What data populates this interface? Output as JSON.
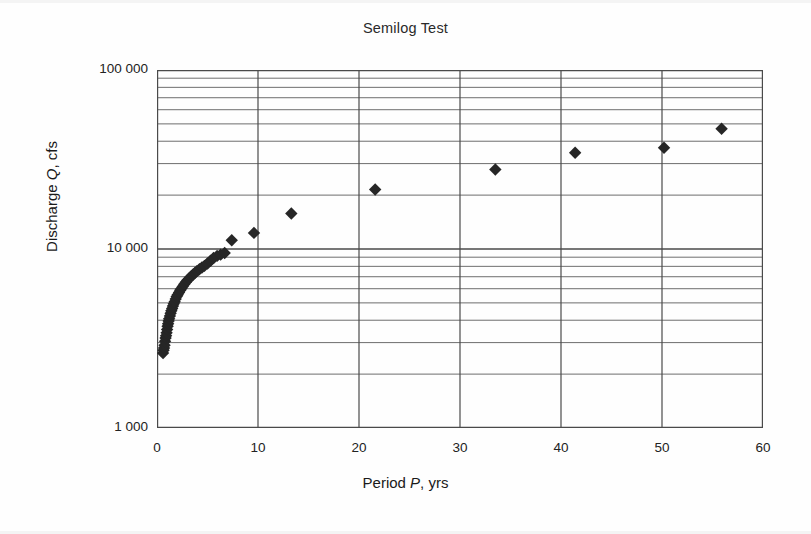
{
  "chart_data": {
    "type": "scatter",
    "title": "Semilog Test",
    "xlabel": "Period P, yrs",
    "xlabel_parts": {
      "pre": "Period ",
      "symbol": "P",
      "post": ", yrs"
    },
    "ylabel": "Discharge Q, cfs",
    "ylabel_parts": {
      "pre": "Discharge ",
      "symbol": "Q",
      "post": ", cfs"
    },
    "x_scale": "linear",
    "y_scale": "log",
    "xlim": [
      0,
      60
    ],
    "ylim": [
      1000,
      100000
    ],
    "grid": "major-and-minor-horizontal-plus-major-vertical",
    "legend": "none",
    "marker": "filled-diamond",
    "marker_color": "#262626",
    "grid_color": "#6e6e6e",
    "axis_color": "#4a4a4a",
    "xticks": [
      0,
      10,
      20,
      30,
      40,
      50,
      60
    ],
    "xtick_labels": [
      "0",
      "10",
      "20",
      "30",
      "40",
      "50",
      "60"
    ],
    "yticks": [
      1000,
      10000,
      100000
    ],
    "ytick_labels": [
      "1 000",
      "10 000",
      "100 000"
    ],
    "y_minor_multipliers": [
      2,
      3,
      4,
      5,
      6,
      7,
      8,
      9
    ],
    "series": [
      {
        "name": "Annual peak discharge",
        "points": [
          [
            0.6,
            2620
          ],
          [
            0.65,
            2720
          ],
          [
            0.7,
            2800
          ],
          [
            0.75,
            2900
          ],
          [
            0.8,
            3050
          ],
          [
            0.85,
            3180
          ],
          [
            0.9,
            3280
          ],
          [
            0.95,
            3400
          ],
          [
            1.0,
            3550
          ],
          [
            1.05,
            3700
          ],
          [
            1.1,
            3820
          ],
          [
            1.15,
            3960
          ],
          [
            1.2,
            4080
          ],
          [
            1.28,
            4230
          ],
          [
            1.35,
            4380
          ],
          [
            1.42,
            4520
          ],
          [
            1.5,
            4650
          ],
          [
            1.58,
            4800
          ],
          [
            1.66,
            4950
          ],
          [
            1.75,
            5080
          ],
          [
            1.85,
            5250
          ],
          [
            1.95,
            5420
          ],
          [
            2.05,
            5560
          ],
          [
            2.18,
            5720
          ],
          [
            2.3,
            5880
          ],
          [
            2.42,
            6020
          ],
          [
            2.55,
            6180
          ],
          [
            2.7,
            6350
          ],
          [
            2.85,
            6520
          ],
          [
            3.0,
            6680
          ],
          [
            3.18,
            6850
          ],
          [
            3.35,
            7000
          ],
          [
            3.55,
            7180
          ],
          [
            3.75,
            7350
          ],
          [
            3.95,
            7520
          ],
          [
            4.2,
            7700
          ],
          [
            4.45,
            7880
          ],
          [
            4.7,
            8050
          ],
          [
            5.0,
            8300
          ],
          [
            5.3,
            8600
          ],
          [
            5.6,
            8900
          ],
          [
            5.95,
            9150
          ],
          [
            6.3,
            9300
          ],
          [
            6.7,
            9500
          ],
          [
            7.4,
            11200
          ],
          [
            9.6,
            12300
          ],
          [
            13.3,
            15800
          ],
          [
            21.6,
            21500
          ],
          [
            33.5,
            27800
          ],
          [
            41.4,
            34500
          ],
          [
            50.2,
            36800
          ],
          [
            55.9,
            47000
          ]
        ]
      }
    ]
  }
}
